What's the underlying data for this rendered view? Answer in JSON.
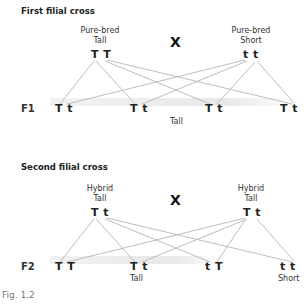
{
  "figure_caption": "Fig. 1.2",
  "first_cross": {
    "title": "First filial cross",
    "parent_left": {
      "line1": "Pure-bred",
      "line2": "Tall",
      "genotype": "T T"
    },
    "parent_right": {
      "line1": "Pure-bred",
      "line2": "Short",
      "genotype": "t t"
    },
    "cross_symbol": "X",
    "generation_label": "F1",
    "offspring": [
      "T t",
      "T t",
      "T t",
      "T t"
    ],
    "phenotype_label": "Tall"
  },
  "second_cross": {
    "title": "Second filial cross",
    "parent_left": {
      "line1": "Hybrid",
      "line2": "Tall",
      "genotype": "T t"
    },
    "parent_right": {
      "line1": "Hybrid",
      "line2": "Tall",
      "genotype": "T t"
    },
    "cross_symbol": "X",
    "generation_label": "F2",
    "offspring": [
      "T T",
      "T t",
      "t T",
      "t t"
    ],
    "phenotype_labels": {
      "tall": "Tall",
      "short": "Short"
    }
  },
  "colors": {
    "line": "#b5b5b5",
    "band": "#ececec",
    "text": "#222222",
    "caption": "#777777"
  }
}
